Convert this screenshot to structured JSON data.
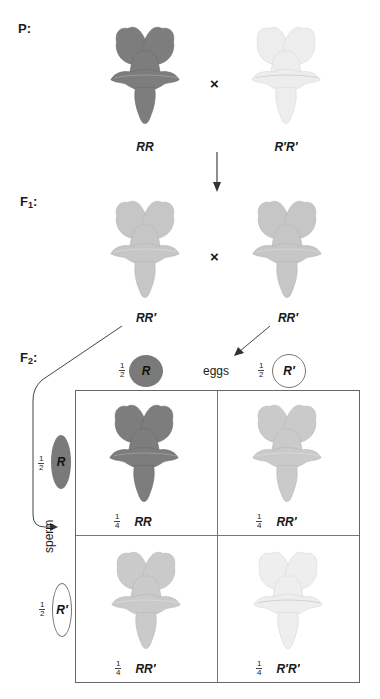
{
  "diagram": {
    "generations": {
      "p": {
        "label": "P:",
        "parents": [
          {
            "genotype": "RR",
            "phenotype": "red",
            "color": "#7d7d7d"
          },
          {
            "genotype": "R′R′",
            "phenotype": "white",
            "color": "#f2f2f2"
          }
        ],
        "cross_symbol": "×"
      },
      "f1": {
        "label_main": "F",
        "label_sub": "1",
        "label_suffix": ":",
        "parents": [
          {
            "genotype": "RR′",
            "phenotype": "pink",
            "color": "#c9c9c9"
          },
          {
            "genotype": "RR′",
            "phenotype": "pink",
            "color": "#c9c9c9"
          }
        ],
        "cross_symbol": "×"
      },
      "f2": {
        "label_main": "F",
        "label_sub": "2",
        "label_suffix": ":"
      }
    },
    "gametes": {
      "eggs_label": "eggs",
      "sperm_label": "sperm",
      "eggs": [
        {
          "allele": "R",
          "frac_num": "1",
          "frac_den": "2",
          "fill": "#7a7a7a"
        },
        {
          "allele": "R′",
          "frac_num": "1",
          "frac_den": "2",
          "fill": "#ffffff"
        }
      ],
      "sperm": [
        {
          "allele": "R",
          "frac_num": "1",
          "frac_den": "2",
          "fill": "#7a7a7a"
        },
        {
          "allele": "R′",
          "frac_num": "1",
          "frac_den": "2",
          "fill": "#ffffff"
        }
      ]
    },
    "punnett": {
      "cells": [
        {
          "genotype": "RR",
          "frac_num": "1",
          "frac_den": "4",
          "phenotype": "red",
          "color": "#7d7d7d"
        },
        {
          "genotype": "RR′",
          "frac_num": "1",
          "frac_den": "4",
          "phenotype": "pink",
          "color": "#c9c9c9"
        },
        {
          "genotype": "RR′",
          "frac_num": "1",
          "frac_den": "4",
          "phenotype": "pink",
          "color": "#c9c9c9"
        },
        {
          "genotype": "R′R′",
          "frac_num": "1",
          "frac_den": "4",
          "phenotype": "white",
          "color": "#efefef"
        }
      ]
    }
  }
}
